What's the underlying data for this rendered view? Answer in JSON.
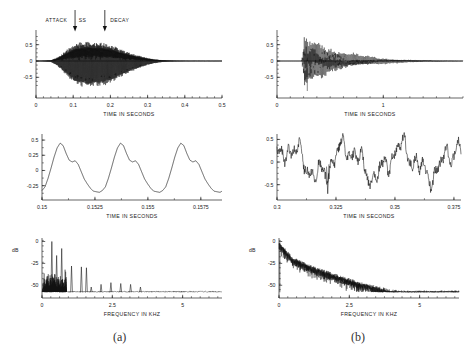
{
  "figure": {
    "captions": [
      {
        "name": "panel-a",
        "text": "(a)"
      },
      {
        "name": "panel-b",
        "text": "(b)"
      }
    ]
  },
  "panels": {
    "a_top": {
      "xlabel": "TIME IN SECONDS",
      "xticks": [
        "0",
        "0.1",
        "0.2",
        "0.3",
        "0.4",
        "0.5"
      ],
      "yticks": [
        "0.5",
        "0",
        "-0.5"
      ],
      "annotations": [
        "ATTACK",
        "SS",
        "DECAY"
      ],
      "arrows": [
        "attack-ss-boundary",
        "ss-decay-boundary"
      ]
    },
    "a_mid": {
      "xlabel": "TIME IN SECONDS",
      "xticks": [
        "0.15",
        "0.1525",
        "0.155",
        "0.1575"
      ],
      "yticks": [
        "0.5",
        "0.25",
        "0",
        "-0.25"
      ]
    },
    "a_bot": {
      "xlabel": "FREQUENCY IN KHZ",
      "ylabel": "dB",
      "xticks": [
        "0",
        "2.5",
        "5"
      ],
      "yticks": [
        "0",
        "-25",
        "-50"
      ]
    },
    "b_top": {
      "xlabel": "TIME IN SECONDS",
      "xticks": [
        "0",
        "1"
      ],
      "yticks": [
        "0.5",
        "0",
        "-0.5"
      ]
    },
    "b_mid": {
      "xlabel": "TIME IN SECONDS",
      "xticks": [
        "0.3",
        "0.325",
        "0.35",
        "0.375"
      ],
      "yticks": [
        "0.5",
        "0",
        "-0.5"
      ]
    },
    "b_bot": {
      "xlabel": "FREQUENCY IN KHZ",
      "ylabel": "dB",
      "xticks": [
        "0",
        "2.5",
        "5"
      ],
      "yticks": [
        "0",
        "-25",
        "-50"
      ]
    }
  },
  "chart_data": [
    {
      "id": "a_top",
      "type": "line",
      "title": "",
      "xlabel": "TIME IN SECONDS",
      "ylabel": "",
      "xlim": [
        0,
        0.5
      ],
      "ylim": [
        -0.95,
        0.95
      ],
      "grid": false,
      "description": "amplitude-modulated tone burst with attack, steady state and decay envelope",
      "envelope_x": [
        0.0,
        0.04,
        0.06,
        0.08,
        0.1,
        0.12,
        0.14,
        0.16,
        0.18,
        0.2,
        0.22,
        0.24,
        0.26,
        0.28,
        0.3,
        0.32,
        0.34,
        0.36,
        0.38,
        0.4,
        0.45,
        0.5
      ],
      "envelope_y": [
        0.0,
        0.03,
        0.18,
        0.45,
        0.7,
        0.82,
        0.85,
        0.83,
        0.8,
        0.72,
        0.58,
        0.44,
        0.32,
        0.22,
        0.13,
        0.07,
        0.035,
        0.02,
        0.012,
        0.008,
        0.004,
        0.002
      ],
      "carrier_hz": 395,
      "annotations": [
        {
          "label": "ATTACK",
          "x": 0.055,
          "y": 0.93
        },
        {
          "label": "SS",
          "x": 0.125,
          "y": 0.93
        },
        {
          "label": "DECAY",
          "x": 0.225,
          "y": 0.93
        },
        {
          "label": "arrow",
          "x": 0.105,
          "y": 0.9
        },
        {
          "label": "arrow",
          "x": 0.185,
          "y": 0.9
        }
      ]
    },
    {
      "id": "a_mid",
      "type": "line",
      "xlabel": "TIME IN SECONDS",
      "ylabel": "",
      "xlim": [
        0.15,
        0.1585
      ],
      "ylim": [
        -0.42,
        0.6
      ],
      "grid": false,
      "description": "three periods of the quasi-periodic steady-state waveform, period about 0.00285 s",
      "period_s": 0.00285,
      "cycle_phase": [
        0.0,
        0.05,
        0.1,
        0.15,
        0.2,
        0.25,
        0.3,
        0.35,
        0.4,
        0.45,
        0.5,
        0.55,
        0.6,
        0.65,
        0.7,
        0.75,
        0.8,
        0.85,
        0.9,
        0.95,
        1.0
      ],
      "cycle_value": [
        -0.33,
        -0.27,
        -0.13,
        0.04,
        0.22,
        0.37,
        0.45,
        0.41,
        0.28,
        0.17,
        0.14,
        0.16,
        0.1,
        -0.02,
        -0.14,
        -0.22,
        -0.29,
        -0.34,
        -0.35,
        -0.36,
        -0.33
      ]
    },
    {
      "id": "a_bot",
      "type": "line",
      "xlabel": "FREQUENCY IN KHZ",
      "ylabel": "dB",
      "xlim": [
        0,
        6.4
      ],
      "ylim": [
        -60,
        4
      ],
      "grid": false,
      "description": "harmonic line spectrum with fundamental near 0.35 kHz and harmonics decaying with frequency",
      "peak_freq_khz": [
        0.18,
        0.3,
        0.35,
        0.52,
        0.7,
        1.05,
        1.4,
        1.58,
        1.75,
        2.1,
        2.45,
        2.8,
        3.15,
        3.5
      ],
      "peak_db": [
        -40,
        -44,
        0,
        -16,
        -8,
        -28,
        -29,
        -30,
        -52,
        -49,
        -47,
        -48,
        -49,
        -52
      ],
      "noise_floor_db": -58
    },
    {
      "id": "b_top",
      "type": "line",
      "xlabel": "TIME IN SECONDS",
      "ylabel": "",
      "xlim": [
        0,
        1.75
      ],
      "ylim": [
        -0.95,
        0.95
      ],
      "grid": false,
      "description": "plucked/struck string tone: sharp attack near 0.25 s followed by long exponential decay",
      "attack_time_s": 0.25,
      "decay_tau_s": 0.33,
      "peak_amplitude": 0.82,
      "carrier_hz": 95
    },
    {
      "id": "b_mid",
      "type": "line",
      "xlabel": "TIME IN SECONDS",
      "ylabel": "",
      "xlim": [
        0.3,
        0.378
      ],
      "ylim": [
        -0.75,
        0.62
      ],
      "grid": false,
      "description": "expanded view of the decaying waveform, irregular inharmonic oscillation",
      "period_s": 0.0235,
      "amplitude_range": [
        -0.68,
        0.52
      ]
    },
    {
      "id": "b_bot",
      "type": "line",
      "xlabel": "FREQUENCY IN KHZ",
      "ylabel": "dB",
      "xlim": [
        0,
        6.4
      ],
      "ylim": [
        -60,
        4
      ],
      "grid": false,
      "description": "dense noisy spectrum falling roughly linearly from 0 dB at 0 kHz to the noise floor near 4 kHz",
      "trend_freq_khz": [
        0.0,
        0.5,
        1.0,
        1.5,
        2.0,
        2.5,
        3.0,
        3.5,
        4.0,
        4.5,
        5.0,
        6.4
      ],
      "trend_db": [
        -2,
        -20,
        -27,
        -33,
        -39,
        -44,
        -49,
        -53,
        -57,
        -58,
        -58,
        -58
      ],
      "noise_floor_db": -58
    }
  ]
}
